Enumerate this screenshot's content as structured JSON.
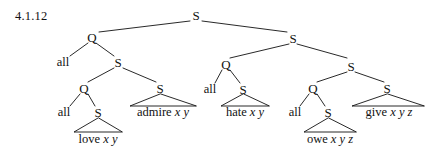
{
  "figure": {
    "example_number": "4.1.12",
    "type": "syntax-tree-diagram",
    "ink_color": "#111111",
    "background_color": "#ffffff"
  },
  "nodes": {
    "root_s": "S",
    "left_q": "Q",
    "right_s": "S",
    "left_all": "all",
    "left_s": "S",
    "left_inner_q": "Q",
    "left_inner_s": "S",
    "left_inner_all": "all",
    "left_leaf_s": "S",
    "right_q": "Q",
    "right_inner_s": "S",
    "right_q_all": "all",
    "right_q_s": "S",
    "right_deep_q": "Q",
    "right_deep_s": "S",
    "right_deep_all": "all",
    "right_deep_q_s": "S"
  },
  "terminals": {
    "love": {
      "word": "love",
      "args": "x y"
    },
    "admire": {
      "word": "admire",
      "args": "x y"
    },
    "hate": {
      "word": "hate",
      "args": "x y"
    },
    "owe": {
      "word": "owe",
      "args": "x y z"
    },
    "give": {
      "word": "give",
      "args": "x y z"
    }
  }
}
